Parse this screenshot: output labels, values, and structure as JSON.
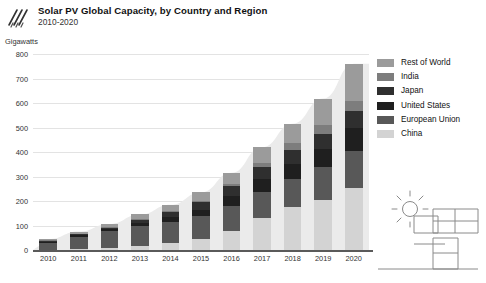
{
  "header": {
    "logo_name": "diagonal-stripes-logo",
    "title": "Solar PV Global Capacity, by Country and Region",
    "subtitle": "2010-2020"
  },
  "legend": {
    "position": "right",
    "items": [
      {
        "label": "Rest of World",
        "color": "#9b9b9b"
      },
      {
        "label": "India",
        "color": "#7d7d7d"
      },
      {
        "label": "Japan",
        "color": "#2f2f2f"
      },
      {
        "label": "United States",
        "color": "#1f1f1f"
      },
      {
        "label": "European Union",
        "color": "#585858"
      },
      {
        "label": "China",
        "color": "#d3d3d3"
      }
    ]
  },
  "illustration": {
    "name": "sun-and-solar-panels-illustration"
  },
  "chart_data": {
    "type": "bar",
    "stacked": true,
    "title": "Solar PV Global Capacity, by Country and Region",
    "subtitle": "2010-2020",
    "xlabel": "",
    "ylabel": "Gigawatts",
    "ylim": [
      0,
      800
    ],
    "ytick_step": 100,
    "yticks": [
      0,
      100,
      200,
      300,
      400,
      500,
      600,
      700,
      800
    ],
    "grid": true,
    "legend_position": "right",
    "categories": [
      "2010",
      "2011",
      "2012",
      "2013",
      "2014",
      "2015",
      "2016",
      "2017",
      "2018",
      "2019",
      "2020"
    ],
    "series": [
      {
        "name": "China",
        "color": "#d3d3d3",
        "values": [
          1,
          3,
          7,
          18,
          28,
          43,
          77,
          130,
          175,
          205,
          254
        ]
      },
      {
        "name": "European Union",
        "color": "#585858",
        "values": [
          30,
          52,
          70,
          81,
          88,
          95,
          102,
          108,
          115,
          132,
          152
        ]
      },
      {
        "name": "United States",
        "color": "#1f1f1f",
        "values": [
          3,
          5,
          8,
          12,
          18,
          25,
          41,
          51,
          62,
          76,
          93
        ]
      },
      {
        "name": "Japan",
        "color": "#2f2f2f",
        "values": [
          4,
          5,
          7,
          14,
          23,
          34,
          42,
          49,
          56,
          62,
          68
        ]
      },
      {
        "name": "India",
        "color": "#7d7d7d",
        "values": [
          1,
          1,
          1,
          2,
          3,
          5,
          9,
          19,
          27,
          35,
          43
        ]
      },
      {
        "name": "Rest of World",
        "color": "#9b9b9b",
        "values": [
          5,
          9,
          13,
          18,
          25,
          33,
          44,
          62,
          80,
          108,
          150
        ]
      }
    ],
    "totals": [
      44,
      75,
      106,
      145,
      185,
      235,
      315,
      419,
      515,
      618,
      760
    ]
  }
}
